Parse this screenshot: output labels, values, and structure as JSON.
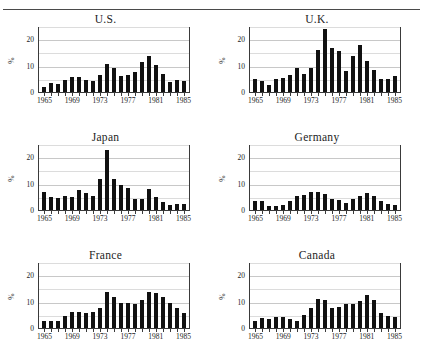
{
  "figure": {
    "name": "inflation-rate-panel-figure",
    "top_rule": true
  },
  "axis": {
    "ylabel": "%",
    "yticks": [
      "0",
      "10",
      "20"
    ],
    "xticks": [
      "1965",
      "1969",
      "1973",
      "1977",
      "1981",
      "1985"
    ]
  },
  "panels": [
    {
      "title": "U.S."
    },
    {
      "title": "U.K."
    },
    {
      "title": "Japan"
    },
    {
      "title": "Germany"
    },
    {
      "title": "France"
    },
    {
      "title": "Canada"
    }
  ],
  "chart_data": [
    {
      "type": "bar",
      "title": "U.S.",
      "xlabel": "",
      "ylabel": "%",
      "ylim": [
        0,
        25
      ],
      "yticks": [
        0,
        10,
        20
      ],
      "grid": true,
      "x": [
        1965,
        1966,
        1967,
        1968,
        1969,
        1970,
        1971,
        1972,
        1973,
        1974,
        1975,
        1976,
        1977,
        1978,
        1979,
        1980,
        1981,
        1982,
        1983,
        1984,
        1985
      ],
      "categories": [
        "1965",
        "1966",
        "1967",
        "1968",
        "1969",
        "1970",
        "1971",
        "1972",
        "1973",
        "1974",
        "1975",
        "1976",
        "1977",
        "1978",
        "1979",
        "1980",
        "1981",
        "1982",
        "1983",
        "1984",
        "1985"
      ],
      "values": [
        1.9,
        3.4,
        3.0,
        4.6,
        5.5,
        5.8,
        4.4,
        4.0,
        6.4,
        10.7,
        9.2,
        5.9,
        6.6,
        7.5,
        11.2,
        13.6,
        10.4,
        6.8,
        3.8,
        4.5,
        4.2
      ]
    },
    {
      "type": "bar",
      "title": "U.K.",
      "xlabel": "",
      "ylabel": "%",
      "ylim": [
        0,
        25
      ],
      "yticks": [
        0,
        10,
        20
      ],
      "grid": true,
      "x": [
        1965,
        1966,
        1967,
        1968,
        1969,
        1970,
        1971,
        1972,
        1973,
        1974,
        1975,
        1976,
        1977,
        1978,
        1979,
        1980,
        1981,
        1982,
        1983,
        1984,
        1985
      ],
      "categories": [
        "1965",
        "1966",
        "1967",
        "1968",
        "1969",
        "1970",
        "1971",
        "1972",
        "1973",
        "1974",
        "1975",
        "1976",
        "1977",
        "1978",
        "1979",
        "1980",
        "1981",
        "1982",
        "1983",
        "1984",
        "1985"
      ],
      "values": [
        5.0,
        4.2,
        2.8,
        5.0,
        5.4,
        6.3,
        9.2,
        7.0,
        9.2,
        15.8,
        24.0,
        16.5,
        15.6,
        7.8,
        13.5,
        17.8,
        11.7,
        8.3,
        4.8,
        5.0,
        6.2
      ]
    },
    {
      "type": "bar",
      "title": "Japan",
      "xlabel": "",
      "ylabel": "%",
      "ylim": [
        0,
        25
      ],
      "yticks": [
        0,
        10,
        20
      ],
      "grid": true,
      "x": [
        1965,
        1966,
        1967,
        1968,
        1969,
        1970,
        1971,
        1972,
        1973,
        1974,
        1975,
        1976,
        1977,
        1978,
        1979,
        1980,
        1981,
        1982,
        1983,
        1984,
        1985
      ],
      "categories": [
        "1965",
        "1966",
        "1967",
        "1968",
        "1969",
        "1970",
        "1971",
        "1972",
        "1973",
        "1974",
        "1975",
        "1976",
        "1977",
        "1978",
        "1979",
        "1980",
        "1981",
        "1982",
        "1983",
        "1984",
        "1985"
      ],
      "values": [
        6.8,
        5.1,
        4.4,
        5.4,
        5.1,
        7.7,
        6.3,
        5.2,
        11.8,
        22.8,
        11.7,
        9.4,
        8.4,
        4.3,
        4.3,
        7.8,
        5.0,
        2.9,
        2.0,
        2.3,
        2.4
      ]
    },
    {
      "type": "bar",
      "title": "Germany",
      "xlabel": "",
      "ylabel": "%",
      "ylim": [
        0,
        25
      ],
      "yticks": [
        0,
        10,
        20
      ],
      "grid": true,
      "x": [
        1965,
        1966,
        1967,
        1968,
        1969,
        1970,
        1971,
        1972,
        1973,
        1974,
        1975,
        1976,
        1977,
        1978,
        1979,
        1980,
        1981,
        1982,
        1983,
        1984,
        1985
      ],
      "categories": [
        "1965",
        "1966",
        "1967",
        "1968",
        "1969",
        "1970",
        "1971",
        "1972",
        "1973",
        "1974",
        "1975",
        "1976",
        "1977",
        "1978",
        "1979",
        "1980",
        "1981",
        "1982",
        "1983",
        "1984",
        "1985"
      ],
      "values": [
        3.3,
        3.6,
        1.6,
        1.5,
        1.9,
        3.4,
        5.2,
        5.5,
        6.9,
        7.0,
        6.0,
        4.3,
        3.7,
        2.7,
        4.1,
        5.4,
        6.3,
        5.3,
        3.3,
        2.4,
        2.0
      ]
    },
    {
      "type": "bar",
      "title": "France",
      "xlabel": "",
      "ylabel": "%",
      "ylim": [
        0,
        25
      ],
      "yticks": [
        0,
        10,
        20
      ],
      "grid": true,
      "x": [
        1965,
        1966,
        1967,
        1968,
        1969,
        1970,
        1971,
        1972,
        1973,
        1974,
        1975,
        1976,
        1977,
        1978,
        1979,
        1980,
        1981,
        1982,
        1983,
        1984,
        1985
      ],
      "categories": [
        "1965",
        "1966",
        "1967",
        "1968",
        "1969",
        "1970",
        "1971",
        "1972",
        "1973",
        "1974",
        "1975",
        "1976",
        "1977",
        "1978",
        "1979",
        "1980",
        "1981",
        "1982",
        "1983",
        "1984",
        "1985"
      ],
      "values": [
        2.6,
        2.7,
        2.7,
        4.6,
        6.1,
        5.9,
        5.5,
        6.2,
        7.6,
        13.7,
        11.8,
        9.6,
        9.4,
        9.1,
        10.8,
        13.5,
        13.4,
        11.8,
        9.6,
        7.7,
        5.8
      ]
    },
    {
      "type": "bar",
      "title": "Canada",
      "xlabel": "",
      "ylabel": "%",
      "ylim": [
        0,
        25
      ],
      "yticks": [
        0,
        10,
        20
      ],
      "grid": true,
      "x": [
        1965,
        1966,
        1967,
        1968,
        1969,
        1970,
        1971,
        1972,
        1973,
        1974,
        1975,
        1976,
        1977,
        1978,
        1979,
        1980,
        1981,
        1982,
        1983,
        1984,
        1985
      ],
      "categories": [
        "1965",
        "1966",
        "1967",
        "1968",
        "1969",
        "1970",
        "1971",
        "1972",
        "1973",
        "1974",
        "1975",
        "1976",
        "1977",
        "1978",
        "1979",
        "1980",
        "1981",
        "1982",
        "1983",
        "1984",
        "1985"
      ],
      "values": [
        2.5,
        3.7,
        3.6,
        4.0,
        4.0,
        3.4,
        2.8,
        4.8,
        7.6,
        10.9,
        10.8,
        7.5,
        8.0,
        9.0,
        9.1,
        10.2,
        12.5,
        10.8,
        5.8,
        4.4,
        4.0
      ]
    }
  ]
}
